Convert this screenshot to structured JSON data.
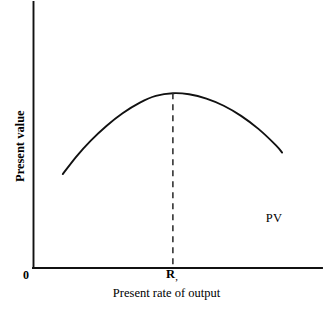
{
  "figure": {
    "background_color": "#ffffff",
    "ink_color": "#111111",
    "origin_label": "0",
    "x_axis_title": "Present rate of output",
    "y_axis_title": "Present value",
    "x_tick_label_main": "R",
    "x_tick_label_subscript": ",",
    "curve_label": "PV"
  },
  "chart_data": {
    "type": "line",
    "title": "",
    "subtitle": "",
    "xlabel": "Present rate of output",
    "ylabel": "Present value",
    "grid": false,
    "legend": "inline-curve-label",
    "axes": {
      "x_axis_ticks": [
        "0",
        "R,"
      ],
      "y_axis_ticks": [],
      "x_axis_origin_label": "0",
      "x_range_qualitative": [
        "0",
        "max rate of output"
      ],
      "y_range_qualitative": [
        "0",
        "max present value"
      ],
      "show_numeric_scale": false
    },
    "annotations": [
      {
        "name": "curve-label",
        "text": "PV",
        "x_frac": 0.826,
        "y_frac": 0.197,
        "describes": "present value curve"
      },
      {
        "name": "optimum-dropline",
        "text": "R,",
        "x_frac": 0.484,
        "describes": "vertical dashed line from curve maximum down to the horizontal axis marking the present-value maximizing rate of output"
      }
    ],
    "series": [
      {
        "name": "PV",
        "label": "PV",
        "shape": "concave-inverted-u",
        "style": "solid",
        "color": "#111111",
        "x": [
          0.103,
          0.15,
          0.2,
          0.255,
          0.31,
          0.37,
          0.425,
          0.484,
          0.54,
          0.6,
          0.66,
          0.72,
          0.78,
          0.84,
          0.862
        ],
        "y": [
          0.353,
          0.419,
          0.479,
          0.535,
          0.582,
          0.622,
          0.647,
          0.657,
          0.653,
          0.637,
          0.61,
          0.572,
          0.523,
          0.462,
          0.434
        ]
      }
    ],
    "markers": [
      {
        "name": "maximum-point",
        "x_frac": 0.484,
        "y_frac": 0.657,
        "label": "R,"
      }
    ]
  }
}
